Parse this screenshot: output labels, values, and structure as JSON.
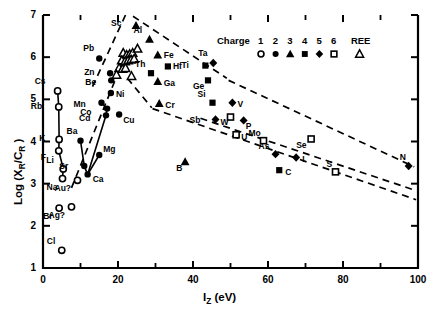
{
  "chart_data": {
    "type": "scatter",
    "title": "",
    "xlabel": "Iz (eV)",
    "ylabel": "Log (XR/CR)",
    "xlim": [
      0,
      100
    ],
    "ylim": [
      1,
      7
    ],
    "xticks": [
      0,
      20,
      40,
      60,
      80,
      100
    ],
    "yticks": [
      1,
      2,
      3,
      4,
      5,
      6,
      7
    ],
    "xminor_step": 10,
    "grid": false,
    "legend": {
      "title": "Charge",
      "position": "top-right",
      "entries": [
        {
          "label": "1",
          "symbol": "open-circle"
        },
        {
          "label": "2",
          "symbol": "filled-circle"
        },
        {
          "label": "3",
          "symbol": "filled-triangle"
        },
        {
          "label": "4",
          "symbol": "filled-square"
        },
        {
          "label": "5",
          "symbol": "filled-diamond"
        },
        {
          "label": "6",
          "symbol": "open-square"
        },
        {
          "label": "REE",
          "symbol": "open-triangle"
        }
      ]
    },
    "points": [
      {
        "label": "Cs",
        "x": 3.9,
        "y": 5.2,
        "symbol": "open-circle",
        "lx": -11,
        "ly": -10
      },
      {
        "label": "Rb",
        "x": 4.2,
        "y": 4.82,
        "symbol": "open-circle",
        "lx": -16,
        "ly": -1
      },
      {
        "label": "K",
        "x": 4.3,
        "y": 4.05,
        "symbol": "open-circle",
        "lx": -13,
        "ly": -1
      },
      {
        "label": "F",
        "x": 4.2,
        "y": 3.78,
        "symbol": "open-circle",
        "lx": -11,
        "ly": 6
      },
      {
        "label": "Li",
        "x": 5.4,
        "y": 3.35,
        "symbol": "open-circle",
        "lx": -5,
        "ly": -9
      },
      {
        "label": "Na",
        "x": 5.2,
        "y": 3.12,
        "symbol": "open-circle",
        "lx": -4,
        "ly": 8
      },
      {
        "label": "Br",
        "x": 4.3,
        "y": 2.42,
        "symbol": "open-circle",
        "lx": -4,
        "ly": 8
      },
      {
        "label": "Ag?",
        "x": 7.6,
        "y": 2.45,
        "symbol": "open-circle",
        "lx": -6,
        "ly": 8
      },
      {
        "label": "Cl",
        "x": 5.0,
        "y": 1.42,
        "symbol": "open-circle",
        "lx": -3,
        "ly": -9
      },
      {
        "label": "Au?",
        "x": 9.2,
        "y": 3.08,
        "symbol": "open-circle",
        "lx": -6,
        "ly": 8
      },
      {
        "label": "Ba",
        "x": 10.0,
        "y": 4.02,
        "symbol": "filled-circle",
        "lx": -2,
        "ly": -10
      },
      {
        "label": "Sr",
        "x": 11.0,
        "y": 3.42,
        "symbol": "filled-circle",
        "lx": -13,
        "ly": 0
      },
      {
        "label": "Ca",
        "x": 11.9,
        "y": 3.22,
        "symbol": "filled-circle",
        "lx": 5,
        "ly": 5
      },
      {
        "label": "Mg",
        "x": 15.0,
        "y": 3.68,
        "symbol": "filled-circle",
        "lx": 4,
        "ly": -6
      },
      {
        "label": "Pb",
        "x": 15.0,
        "y": 5.97,
        "symbol": "filled-circle",
        "lx": -4,
        "ly": -10
      },
      {
        "label": "Zn",
        "x": 17.9,
        "y": 5.62,
        "symbol": "filled-circle",
        "lx": -14,
        "ly": -1
      },
      {
        "label": "Be",
        "x": 18.2,
        "y": 5.45,
        "symbol": "filled-circle",
        "lx": -14,
        "ly": 2
      },
      {
        "label": "Ni",
        "x": 18.1,
        "y": 5.15,
        "symbol": "filled-circle",
        "lx": 5,
        "ly": 1
      },
      {
        "label": "Mn",
        "x": 15.6,
        "y": 4.92,
        "symbol": "filled-circle",
        "lx": -16,
        "ly": 1
      },
      {
        "label": "Co",
        "x": 17.1,
        "y": 4.78,
        "symbol": "filled-circle",
        "lx": -15,
        "ly": 3
      },
      {
        "label": "Cd",
        "x": 16.8,
        "y": 4.62,
        "symbol": "filled-circle",
        "lx": -15,
        "ly": 3
      },
      {
        "label": "Cu",
        "x": 20.3,
        "y": 4.64,
        "symbol": "filled-circle",
        "lx": 4,
        "ly": 5
      },
      {
        "label": "Hf",
        "x": 33.3,
        "y": 5.78,
        "symbol": "filled-square",
        "lx": 5,
        "ly": 0
      },
      {
        "label": "Th",
        "x": 28.8,
        "y": 5.62,
        "symbol": "filled-square",
        "lx": -4,
        "ly": -9
      },
      {
        "label": "Ti",
        "x": 43.3,
        "y": 5.8,
        "symbol": "filled-square",
        "lx": -12,
        "ly": -1
      },
      {
        "label": "Ta",
        "x": 45.4,
        "y": 5.86,
        "symbol": "filled-diamond",
        "lx": -3,
        "ly": -10
      },
      {
        "label": "Ge",
        "x": 44.0,
        "y": 5.45,
        "symbol": "filled-square",
        "lx": -3,
        "ly": 6
      },
      {
        "label": "Si",
        "x": 45.2,
        "y": 4.92,
        "symbol": "filled-square",
        "lx": -3,
        "ly": -9
      },
      {
        "label": "Sc",
        "x": 24.8,
        "y": 6.75,
        "symbol": "filled-triangle",
        "lx": -13,
        "ly": -3
      },
      {
        "label": "Al",
        "x": 28.4,
        "y": 6.42,
        "symbol": "filled-triangle",
        "lx": -4,
        "ly": -9
      },
      {
        "label": "Fe",
        "x": 30.6,
        "y": 6.05,
        "symbol": "filled-triangle",
        "lx": 6,
        "ly": 0
      },
      {
        "label": "Ga",
        "x": 30.6,
        "y": 5.42,
        "symbol": "filled-triangle",
        "lx": 6,
        "ly": 1
      },
      {
        "label": "Cr",
        "x": 31.0,
        "y": 4.9,
        "symbol": "filled-triangle",
        "lx": 6,
        "ly": 1
      },
      {
        "label": "B",
        "x": 37.9,
        "y": 3.52,
        "symbol": "filled-triangle",
        "lx": -2,
        "ly": 6
      },
      {
        "label": "V",
        "x": 50.5,
        "y": 4.92,
        "symbol": "filled-diamond",
        "lx": 5,
        "ly": 1
      },
      {
        "label": "Sb",
        "x": 46.0,
        "y": 4.52,
        "symbol": "filled-diamond",
        "lx": -14,
        "ly": 0
      },
      {
        "label": "W",
        "x": 50.0,
        "y": 4.58,
        "symbol": "open-square",
        "lx": -3,
        "ly": 5
      },
      {
        "label": "P",
        "x": 53.5,
        "y": 4.5,
        "symbol": "filled-diamond",
        "lx": 2,
        "ly": 6
      },
      {
        "label": "U",
        "x": 51.5,
        "y": 4.16,
        "symbol": "open-square",
        "lx": 5,
        "ly": 2
      },
      {
        "label": "Mo",
        "x": 58.8,
        "y": 4.02,
        "symbol": "open-square",
        "lx": -3,
        "ly": -8
      },
      {
        "label": "Se",
        "x": 71.5,
        "y": 4.06,
        "symbol": "open-square",
        "lx": -3,
        "ly": 6
      },
      {
        "label": "As",
        "x": 62.0,
        "y": 3.7,
        "symbol": "filled-diamond",
        "lx": -5,
        "ly": -8
      },
      {
        "label": "I",
        "x": 67.5,
        "y": 3.62,
        "symbol": "filled-diamond",
        "lx": 6,
        "ly": 1
      },
      {
        "label": "C",
        "x": 63.0,
        "y": 3.32,
        "symbol": "filled-square",
        "lx": 6,
        "ly": 2
      },
      {
        "label": "S",
        "x": 78.0,
        "y": 3.28,
        "symbol": "open-square",
        "lx": -2,
        "ly": -8
      },
      {
        "label": "N",
        "x": 97.5,
        "y": 3.42,
        "symbol": "filled-diamond",
        "lx": -2,
        "ly": -9
      }
    ],
    "ree_points": [
      {
        "x": 21.4,
        "y": 6.1
      },
      {
        "x": 22.3,
        "y": 6.05
      },
      {
        "x": 23.1,
        "y": 6.07
      },
      {
        "x": 23.9,
        "y": 6.1
      },
      {
        "x": 25.2,
        "y": 6.2
      },
      {
        "x": 21.0,
        "y": 5.92
      },
      {
        "x": 21.9,
        "y": 5.9
      },
      {
        "x": 22.7,
        "y": 5.92
      },
      {
        "x": 23.5,
        "y": 5.94
      },
      {
        "x": 24.3,
        "y": 5.96
      },
      {
        "x": 20.3,
        "y": 5.74
      },
      {
        "x": 21.2,
        "y": 5.72
      },
      {
        "x": 22.0,
        "y": 5.74
      },
      {
        "x": 19.6,
        "y": 5.58
      },
      {
        "x": 23.6,
        "y": 5.55
      }
    ],
    "connector_series": [
      {
        "name": "alkali-line",
        "points": [
          [
            3.9,
            5.2
          ],
          [
            4.2,
            4.82
          ],
          [
            4.3,
            4.05
          ],
          [
            4.2,
            3.78
          ],
          [
            5.4,
            3.35
          ],
          [
            5.2,
            3.12
          ]
        ]
      },
      {
        "name": "alkaline-earth-line",
        "points": [
          [
            10.0,
            4.02
          ],
          [
            11.0,
            3.42
          ],
          [
            11.9,
            3.22
          ],
          [
            15.0,
            3.68
          ]
        ]
      },
      {
        "name": "transition-line",
        "points": [
          [
            15.6,
            4.92
          ],
          [
            17.1,
            4.78
          ],
          [
            16.8,
            4.62
          ],
          [
            11.9,
            3.22
          ]
        ]
      }
    ],
    "envelope_lines": [
      {
        "name": "upper-left-boundary",
        "points": [
          [
            13.2,
            5.3
          ],
          [
            22.0,
            7.0
          ]
        ]
      },
      {
        "name": "upper-right-boundary",
        "points": [
          [
            24.0,
            6.97
          ],
          [
            49.0,
            5.5
          ]
        ]
      },
      {
        "name": "lower-left-boundary",
        "points": [
          [
            7.6,
            2.9
          ],
          [
            21.5,
            5.95
          ]
        ]
      },
      {
        "name": "mid-boundary",
        "points": [
          [
            22.5,
            5.5
          ],
          [
            29.0,
            4.8
          ]
        ]
      },
      {
        "name": "lower-right-boundary",
        "points": [
          [
            29.2,
            4.78
          ],
          [
            99.5,
            2.62
          ]
        ]
      },
      {
        "name": "outer-right-boundary",
        "points": [
          [
            49.5,
            5.45
          ],
          [
            99.0,
            3.4
          ]
        ]
      },
      {
        "name": "outer-lower-boundary",
        "points": [
          [
            42.0,
            4.55
          ],
          [
            99.0,
            2.85
          ]
        ]
      }
    ]
  }
}
